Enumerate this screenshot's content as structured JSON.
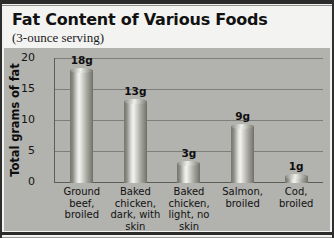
{
  "chart_data": {
    "type": "bar",
    "title": "Fat Content of Various Foods",
    "subtitle": "(3-ounce serving)",
    "xlabel": "",
    "ylabel": "Total grams of fat",
    "ylim": [
      0,
      20
    ],
    "yticks": [
      0,
      5,
      10,
      15,
      20
    ],
    "ytick_labels": [
      "0",
      "5",
      "10",
      "15",
      "20"
    ],
    "grid": true,
    "legend": false,
    "categories": [
      "Ground beef, broiled",
      "Baked chicken, dark, with skin",
      "Baked chicken, light, no skin",
      "Salmon, broiled",
      "Cod, broiled"
    ],
    "category_lines": [
      [
        "Ground",
        "beef,",
        "broiled"
      ],
      [
        "Baked",
        "chicken,",
        "dark, with",
        "skin"
      ],
      [
        "Baked",
        "chicken,",
        "light, no",
        "skin"
      ],
      [
        "Salmon,",
        "broiled"
      ],
      [
        "Cod,",
        "broiled"
      ]
    ],
    "values": [
      18,
      13,
      3,
      9,
      1
    ],
    "value_labels": [
      "18g",
      "13g",
      "3g",
      "9g",
      "1g"
    ],
    "units": "grams of fat"
  },
  "colors": {
    "page_background": "#f2f2f0",
    "plot_background": "#b2b2ae",
    "bar_light": "#f3f3f0",
    "bar_dark": "#6e6e67",
    "axis": "#5d5d5a",
    "gridline": "#7e7e7b",
    "text": "#111111",
    "rule": "#2b2b2b"
  }
}
